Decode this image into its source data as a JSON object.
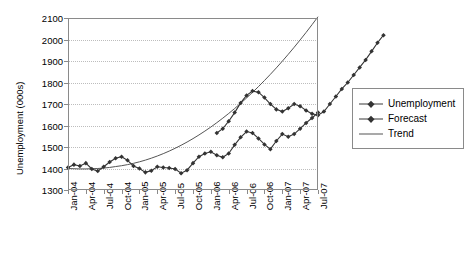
{
  "chart_data": {
    "type": "line",
    "title": "",
    "xlabel": "",
    "ylabel": "Unemployment (000s)",
    "ylim": [
      1300,
      2100
    ],
    "yticks": [
      1300,
      1400,
      1500,
      1600,
      1700,
      1800,
      1900,
      2000,
      2100
    ],
    "grid": true,
    "legend_position": "right",
    "x": [
      "Jan-04",
      "Feb-04",
      "Mar-04",
      "Apr-04",
      "May-04",
      "Jun-04",
      "Jul-04",
      "Aug-04",
      "Sep-04",
      "Oct-04",
      "Nov-04",
      "Dec-04",
      "Jan-05",
      "Feb-05",
      "Mar-05",
      "Apr-05",
      "May-05",
      "Jun-05",
      "Jul-05",
      "Aug-05",
      "Sep-05",
      "Oct-05",
      "Nov-05",
      "Dec-05",
      "Jan-06",
      "Feb-06",
      "Mar-06",
      "Apr-06",
      "May-06",
      "Jun-06",
      "Jul-06",
      "Aug-06",
      "Sep-06",
      "Oct-06",
      "Nov-06",
      "Dec-06",
      "Jan-07",
      "Feb-07",
      "Mar-07",
      "Apr-07",
      "May-07",
      "Jun-07",
      "Jul-07"
    ],
    "xtick_labels": [
      "Jan-04",
      "Apr-04",
      "Jul-04",
      "Oct-04",
      "Jan-05",
      "Apr-05",
      "Jul-05",
      "Oct-05",
      "Jan-06",
      "Apr-06",
      "Jul-06",
      "Oct-06",
      "Jan-07",
      "Apr-07",
      "Jul-07"
    ],
    "series": [
      {
        "name": "Unemployment",
        "marker": "diamond",
        "color": "#333333",
        "values": [
          1405,
          1418,
          1412,
          1425,
          1398,
          1388,
          1408,
          1430,
          1448,
          1455,
          1438,
          1412,
          1400,
          1382,
          1390,
          1408,
          1405,
          1402,
          1398,
          1378,
          1392,
          1425,
          1455,
          1470,
          1478,
          1462,
          1452,
          1470,
          1510,
          1545,
          1572,
          1565,
          1540,
          1512,
          1490,
          1528,
          1560,
          1548,
          1560,
          1585,
          1612,
          1635,
          1660
        ]
      },
      {
        "name": "Forecast",
        "marker": "diamond",
        "color": "#333333",
        "values": [
          null,
          null,
          null,
          null,
          null,
          null,
          null,
          null,
          null,
          null,
          null,
          null,
          null,
          null,
          null,
          null,
          null,
          null,
          null,
          null,
          null,
          null,
          null,
          null,
          null,
          null,
          null,
          1470,
          1510,
          1545,
          1572,
          1565,
          1540,
          1512,
          1490,
          1528,
          1560,
          1548,
          1560,
          1585,
          1612,
          1635,
          1660
        ]
      },
      {
        "name": "Trend",
        "marker": "none",
        "color": "#555555",
        "values": [
          1400,
          1399,
          1398,
          1398,
          1399,
          1400,
          1402,
          1405,
          1409,
          1413,
          1418,
          1424,
          1431,
          1439,
          1448,
          1458,
          1469,
          1481,
          1494,
          1508,
          1523,
          1539,
          1556,
          1574,
          1593,
          1613,
          1634,
          1656,
          1679,
          1703,
          1728,
          1754,
          1781,
          1809,
          1838,
          1868,
          1899,
          1931,
          1964,
          1998,
          2033,
          2069,
          2106
        ]
      }
    ],
    "observed": [
      1405,
      1418,
      1412,
      1425,
      1398,
      1388,
      1408,
      1430,
      1448,
      1455,
      1438,
      1412,
      1400,
      1382,
      1390,
      1408,
      1405,
      1402,
      1398,
      1378,
      1392,
      1425,
      1455,
      1470,
      1478,
      1462,
      1452,
      1470,
      1510,
      1545,
      1572,
      1565,
      1540,
      1512,
      1490,
      1528,
      1560,
      1548,
      1560,
      1585,
      1612,
      1635,
      1660
    ],
    "unemployment_branch": [
      1405,
      1418,
      1412,
      1425,
      1398,
      1388,
      1408,
      1430,
      1448,
      1455,
      1438,
      1412,
      1400,
      1382,
      1390,
      1408,
      1405,
      1402,
      1398,
      1378,
      1392,
      1425,
      1455,
      1470,
      1478,
      1462,
      1452,
      1470,
      1510,
      1545,
      1572,
      1565,
      1540,
      1512,
      1490,
      1528,
      1560,
      1548,
      1560,
      1585,
      1612,
      1635,
      1660
    ],
    "forecast_branch": [
      1565,
      1585,
      1620,
      1660,
      1705,
      1740,
      1760,
      1755,
      1730,
      1700,
      1675,
      1665,
      1680,
      1700,
      1690,
      1670,
      1655,
      1648,
      1665,
      1700,
      1735,
      1770,
      1800,
      1835,
      1870,
      1905,
      1945,
      1985,
      2020
    ],
    "forecast_branch_start_index": 25
  },
  "legend": {
    "entries": [
      {
        "label": "Unemployment",
        "type": "line-marker"
      },
      {
        "label": "Forecast",
        "type": "line-marker"
      },
      {
        "label": "Trend",
        "type": "line"
      }
    ]
  }
}
